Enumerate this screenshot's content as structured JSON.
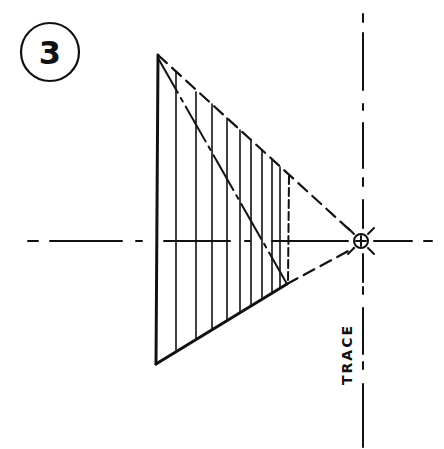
{
  "figure": {
    "number_label": "3",
    "trace_label": "TRACE",
    "ink_color": "#111111",
    "background_color": "#ffffff"
  },
  "geometry": {
    "vanishing_point": {
      "x": 361,
      "y": 241
    },
    "horizon_line_y": 241,
    "trace_line_x": 362,
    "shape": {
      "top_left": {
        "x": 158,
        "y": 55
      },
      "bottom_left": {
        "x": 156,
        "y": 364
      },
      "bottom_right": {
        "x": 287,
        "y": 284
      },
      "top_right_dashed": {
        "x": 290,
        "y": 175
      }
    },
    "hatch_lines_x": [
      176,
      196,
      212,
      227,
      240,
      251,
      262,
      272,
      280
    ]
  }
}
